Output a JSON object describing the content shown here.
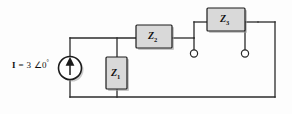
{
  "figure": {
    "type": "circuit-schematic"
  },
  "source": {
    "name": "current-source",
    "symbol": "circle-with-up-arrow",
    "label_full": "I = 3 ∠0°",
    "quantity": "I",
    "equals": "=",
    "magnitude": "3",
    "angle_symbol": "∠",
    "angle_value": "0",
    "degree_symbol": "°",
    "direction": "up"
  },
  "impedances": [
    {
      "id": "z1",
      "letter": "Z",
      "subscript": "1",
      "orientation": "vertical",
      "label": "Z1"
    },
    {
      "id": "z2",
      "letter": "Z",
      "subscript": "2",
      "orientation": "horizontal",
      "label": "Z2"
    },
    {
      "id": "z3",
      "letter": "Z",
      "subscript": "3",
      "orientation": "horizontal",
      "label": "Z3"
    }
  ],
  "terminals": [
    {
      "id": "terminal-left",
      "style": "open-circle"
    },
    {
      "id": "terminal-right",
      "style": "open-circle"
    }
  ],
  "colors": {
    "wire": "#2b2b2b",
    "box_fill": "#d9d9d9",
    "box_stroke": "#1c1c1c",
    "shadow": "#9a9a9a",
    "background": "#fdfdfd",
    "text": "#111111"
  }
}
